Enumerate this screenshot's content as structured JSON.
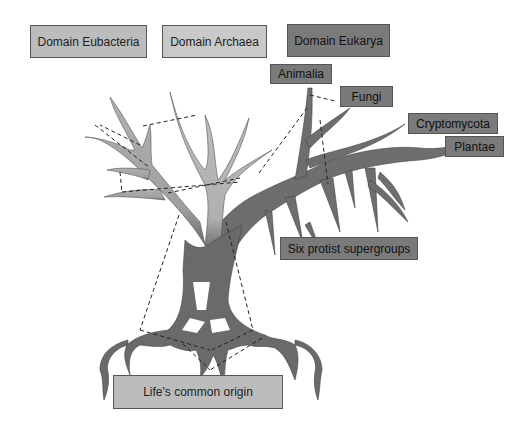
{
  "domains": [
    {
      "label": "Domain Eubacteria",
      "shade": "#bcbcbc"
    },
    {
      "label": "Domain Archaea",
      "shade": "#c9c9c9"
    },
    {
      "label": "Domain Eukarya",
      "shade": "#7a7a7a"
    }
  ],
  "groups": {
    "animalia": "Animalia",
    "fungi": "Fungi",
    "cryptomycota": "Cryptomycota",
    "plantae": "Plantae",
    "protists": "Six protist supergroups"
  },
  "origin": "Life's common origin",
  "colors": {
    "bacteria_branch": "#a8a8a8",
    "archaea_branch": "#b8b8b8",
    "eukarya_branch": "#6f6f6f",
    "dashes": "#222222"
  }
}
